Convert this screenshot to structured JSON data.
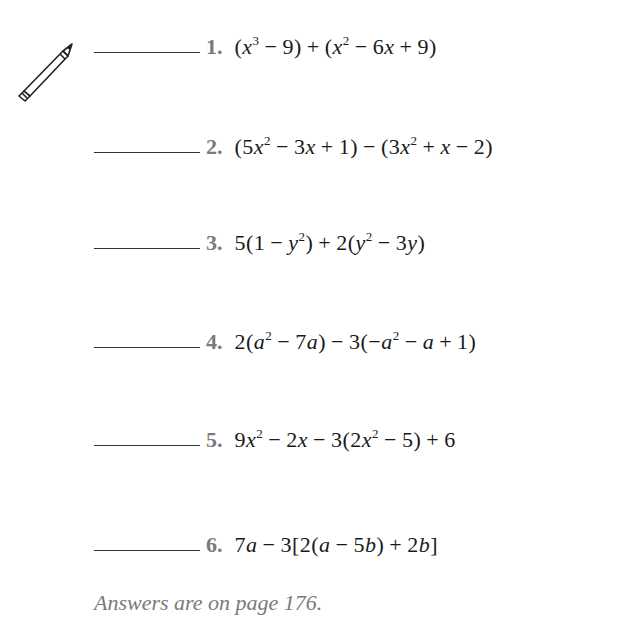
{
  "icon": {
    "name": "pencil-icon"
  },
  "problems": [
    {
      "number": "1.",
      "expression": "(x³ − 9) + (x² − 6x + 9)",
      "answer": ""
    },
    {
      "number": "2.",
      "expression": "(5x² − 3x + 1) − (3x² + x − 2)",
      "answer": ""
    },
    {
      "number": "3.",
      "expression": "5(1 − y²) + 2(y² − 3y)",
      "answer": ""
    },
    {
      "number": "4.",
      "expression": "2(a² − 7a) − 3(−a² − a + 1)",
      "answer": ""
    },
    {
      "number": "5.",
      "expression": "9x² − 2x − 3(2x² − 5) + 6",
      "answer": ""
    },
    {
      "number": "6.",
      "expression": "7a − 3[2(a − 5b) + 2b]",
      "answer": ""
    }
  ],
  "footnote": "Answers are on page 176."
}
